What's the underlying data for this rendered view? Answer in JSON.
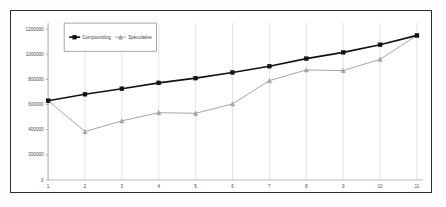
{
  "chart_data": {
    "type": "line",
    "title": "",
    "subtitle": "",
    "xlabel": "",
    "ylabel": "",
    "x": [
      1,
      2,
      3,
      4,
      5,
      6,
      7,
      8,
      9,
      10,
      11
    ],
    "categories": [
      "1",
      "2",
      "3",
      "4",
      "5",
      "6",
      "7",
      "8",
      "9",
      "10",
      "11"
    ],
    "series": [
      {
        "name": "Compounding",
        "color": "#121212",
        "marker": "square",
        "values": [
          630000,
          682000,
          725000,
          772000,
          810000,
          855000,
          905000,
          965000,
          1015000,
          1075000,
          1150000
        ]
      },
      {
        "name": "Speculative",
        "color": "#9b9b9b",
        "marker": "triangle",
        "values": [
          630000,
          385000,
          470000,
          535000,
          530000,
          605000,
          790000,
          875000,
          870000,
          960000,
          1150000
        ]
      }
    ],
    "ylim": [
      0,
      1200000
    ],
    "yticks": [
      0,
      200000,
      400000,
      600000,
      800000,
      1000000,
      1200000
    ],
    "ytick_labels": [
      "0",
      "200000",
      "400000",
      "600000",
      "800000",
      "1000000",
      "1200000"
    ],
    "xtick_labels": [
      "1",
      "2",
      "3",
      "4",
      "5",
      "6",
      "7",
      "8",
      "9",
      "10",
      "11"
    ],
    "grid": {
      "vertical": true,
      "horizontal": false
    },
    "legend": {
      "position": "top-left-inside",
      "entries": [
        {
          "label": "Compounding",
          "marker": "square",
          "color": "#121212"
        },
        {
          "label": "Speculative",
          "marker": "triangle",
          "color": "#9b9b9b"
        }
      ]
    },
    "plot_background": "#ffffff",
    "border_color": "#2b2b2b"
  }
}
